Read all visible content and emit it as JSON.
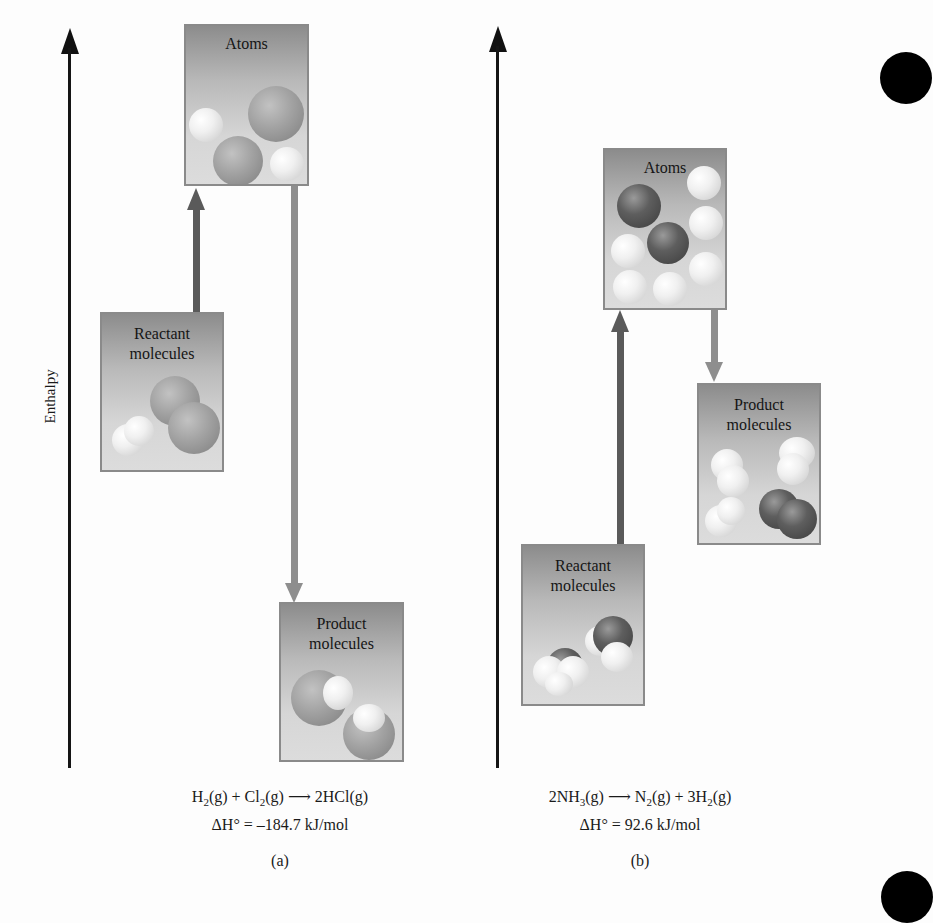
{
  "figure": {
    "y_axis_label": "Enthalpy",
    "colors": {
      "axis": "#151515",
      "up_arrow": "#5a5a5a",
      "down_arrow": "#8e8e8e",
      "box_border": "#8a8a8a"
    },
    "panel_a": {
      "boxes": {
        "atoms": "Atoms",
        "reactants_line1": "Reactant",
        "reactants_line2": "molecules",
        "products_line1": "Product",
        "products_line2": "molecules"
      },
      "equation": {
        "r1": "H",
        "r1_sub": "2",
        "r1_state": "(g)",
        "plus": " + ",
        "r2": "Cl",
        "r2_sub": "2",
        "r2_state": "(g)",
        "arrow": " ⟶ ",
        "p1": "2HCl",
        "p1_state": "(g)"
      },
      "delta_h": "ΔH° = –184.7 kJ/mol",
      "label": "(a)"
    },
    "panel_b": {
      "boxes": {
        "atoms": "Atoms",
        "reactants_line1": "Reactant",
        "reactants_line2": "molecules",
        "products_line1": "Product",
        "products_line2": "molecules"
      },
      "equation": {
        "r1": "2NH",
        "r1_sub": "3",
        "r1_state": "(g)",
        "arrow": " ⟶ ",
        "p1": "N",
        "p1_sub": "2",
        "p1_state": "(g)",
        "plus": " +  ",
        "p2": "3H",
        "p2_sub": "2",
        "p2_state": "(g)"
      },
      "delta_h": "ΔH° = 92.6 kJ/mol",
      "label": "(b)"
    }
  }
}
